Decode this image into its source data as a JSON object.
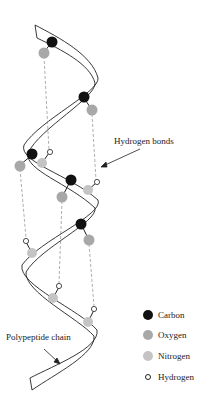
{
  "diagram": {
    "labels": {
      "hydrogen_bonds": "Hydrogen bonds",
      "polypeptide_chain": "Polypeptide chain"
    },
    "legend": [
      {
        "name": "Carbon",
        "color": "#111111",
        "key": "carbon"
      },
      {
        "name": "Oxygen",
        "color": "#a8a8a8",
        "key": "oxygen"
      },
      {
        "name": "Nitrogen",
        "color": "#c4c4c4",
        "key": "nitrogen"
      },
      {
        "name": "Hydrogen",
        "color": "#ffffff",
        "key": "hydrogen"
      }
    ],
    "colors": {
      "carbon": "#111111",
      "oxygen": "#a8a8a8",
      "nitrogen": "#c4c4c4",
      "hydrogen_fill": "#ffffff",
      "outline": "#222222",
      "bond_line": "#777777"
    }
  }
}
